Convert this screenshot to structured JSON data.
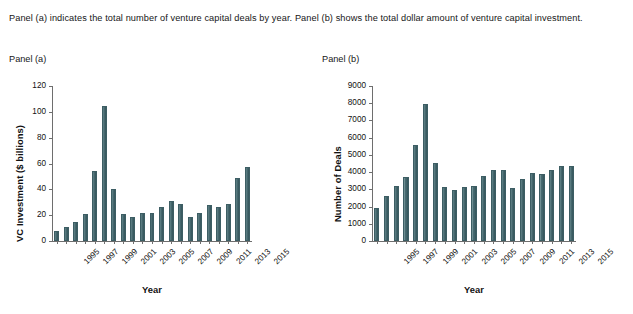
{
  "caption": "Panel (a) indicates the total number of venture capital deals by year. Panel (b) shows the total dollar amount of venture capital investment.",
  "panels": {
    "a": {
      "label": "Panel (a)"
    },
    "b": {
      "label": "Panel (b)"
    }
  },
  "colors": {
    "bar_fill": "#41646a",
    "bar_edge": "#3d5e64",
    "axis": "#6e6e6e",
    "text": "#161616",
    "background": "#ffffff"
  },
  "chart_data": [
    {
      "type": "bar",
      "id": "panel-a",
      "title": "Panel (a)",
      "xlabel": "Year",
      "ylabel": "VC Investment ($ billions)",
      "ylim": [
        0,
        120
      ],
      "yticks": [
        0,
        20,
        40,
        60,
        80,
        100,
        120
      ],
      "ytick_labels": [
        "0",
        "20",
        "40",
        "60",
        "80",
        "100",
        "120"
      ],
      "grid": false,
      "legend": "none",
      "categories": [
        1995,
        1996,
        1997,
        1998,
        1999,
        2000,
        2001,
        2002,
        2003,
        2004,
        2005,
        2006,
        2007,
        2008,
        2009,
        2010,
        2011,
        2012,
        2013,
        2014,
        2015
      ],
      "xtick_labels": [
        "1995",
        "1997",
        "1999",
        "2001",
        "2003",
        "2005",
        "2007",
        "2009",
        "2011",
        "2013",
        "2015"
      ],
      "xtick_categories": [
        1995,
        1997,
        1999,
        2001,
        2003,
        2005,
        2007,
        2009,
        2011,
        2013,
        2015
      ],
      "values": [
        7.5,
        11.0,
        14.5,
        21.0,
        54.5,
        104.5,
        40.0,
        21.0,
        18.5,
        22.0,
        22.0,
        26.5,
        31.0,
        29.0,
        18.5,
        22.0,
        28.0,
        26.0,
        28.5,
        49.0,
        57.5
      ],
      "units": "$ billions"
    },
    {
      "type": "bar",
      "id": "panel-b",
      "title": "Panel (b)",
      "xlabel": "Year",
      "ylabel": "Number of Deals",
      "ylim": [
        0,
        9000
      ],
      "yticks": [
        0,
        1000,
        2000,
        3000,
        4000,
        5000,
        6000,
        7000,
        8000,
        9000
      ],
      "ytick_labels": [
        "0",
        "1000",
        "2000",
        "3000",
        "4000",
        "5000",
        "6000",
        "7000",
        "8000",
        "9000"
      ],
      "grid": false,
      "legend": "none",
      "categories": [
        1995,
        1996,
        1997,
        1998,
        1999,
        2000,
        2001,
        2002,
        2003,
        2004,
        2005,
        2006,
        2007,
        2008,
        2009,
        2010,
        2011,
        2012,
        2013,
        2014,
        2015
      ],
      "xtick_labels": [
        "1995",
        "1997",
        "1999",
        "2001",
        "2003",
        "2005",
        "2007",
        "2009",
        "2011",
        "2013",
        "2015"
      ],
      "xtick_categories": [
        1995,
        1997,
        1999,
        2001,
        2003,
        2005,
        2007,
        2009,
        2011,
        2013,
        2015
      ],
      "values": [
        1900,
        2620,
        3180,
        3700,
        5570,
        7980,
        4520,
        3150,
        2970,
        3160,
        3220,
        3800,
        4130,
        4100,
        3080,
        3580,
        3960,
        3880,
        4150,
        4330,
        4340
      ],
      "units": "deals"
    }
  ]
}
